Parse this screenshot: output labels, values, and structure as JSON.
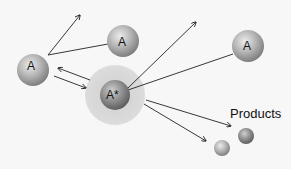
{
  "diagram": {
    "molecules": [
      {
        "id": "left",
        "label": "A",
        "cx": 33,
        "cy": 70,
        "r": 16
      },
      {
        "id": "top-middle",
        "label": "A",
        "cx": 123,
        "cy": 41,
        "r": 16
      },
      {
        "id": "top-right",
        "label": "A",
        "cx": 248,
        "cy": 46,
        "r": 16
      }
    ],
    "activated": {
      "label": "A*",
      "cx": 115,
      "cy": 95,
      "r": 15,
      "halo_r": 30
    },
    "products": {
      "label": "Products",
      "spheres": [
        {
          "cx": 246,
          "cy": 136,
          "r": 8
        },
        {
          "cx": 222,
          "cy": 148,
          "r": 8
        }
      ]
    },
    "colors": {
      "background": "#f7f7f7",
      "sphere_light": "#e6e6e6",
      "sphere_dark": "#8a8a8a",
      "halo": "#d4d4d4",
      "arrow": "#222222"
    }
  }
}
